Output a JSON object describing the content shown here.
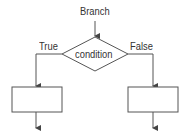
{
  "diagram": {
    "entry_label": "Branch",
    "condition_label": "condition",
    "true_label": "True",
    "false_label": "False",
    "stroke_color": "#555555",
    "text_color": "#333333"
  }
}
